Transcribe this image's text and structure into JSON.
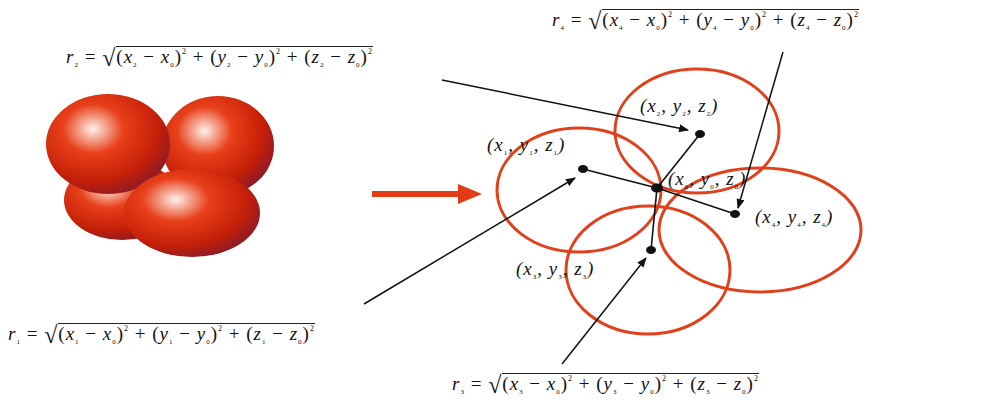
{
  "diagram": {
    "left_image": {
      "description": "cluster of four red shaded spheres",
      "color": "#d42a0c"
    },
    "transition_arrow": {
      "color": "#e43a16",
      "direction": "right"
    },
    "circle_color": "#e0401c",
    "points": [
      {
        "id": "p0",
        "label": "(x0, y0, z0)",
        "var": "0"
      },
      {
        "id": "p1",
        "label": "(x1, y1, z1)",
        "var": "1"
      },
      {
        "id": "p2",
        "label": "(x2, y2, z2)",
        "var": "2"
      },
      {
        "id": "p3",
        "label": "(x3, y3, z3)",
        "var": "3"
      },
      {
        "id": "p4",
        "label": "(x4, y4, z4)",
        "var": "4"
      }
    ],
    "formulas": [
      {
        "id": "r1",
        "text": "r1 = √((x1 − x0)² + (y1 − y0)² + (z1 − z0)²)",
        "index": "1"
      },
      {
        "id": "r2",
        "text": "r2 = √((x2 − x0)² + (y2 − y0)² + (z2 − z0)²)",
        "index": "2"
      },
      {
        "id": "r3",
        "text": "r3 = √((x3 − x0)² + (y3 − y0)² + (z3 − z0)²)",
        "index": "3"
      },
      {
        "id": "r4",
        "text": "r4 = √((x4 − x0)² + (y4 − y0)² + (z4 − z0)²)",
        "index": "4"
      }
    ],
    "symbols": {
      "r": "r",
      "x": "x",
      "y": "y",
      "z": "z",
      "eq": "=",
      "minus": "−",
      "plus": "+",
      "sq": "2",
      "root": "√",
      "lp": "(",
      "rp": ")",
      "comma": ",",
      "zero": "0"
    }
  }
}
